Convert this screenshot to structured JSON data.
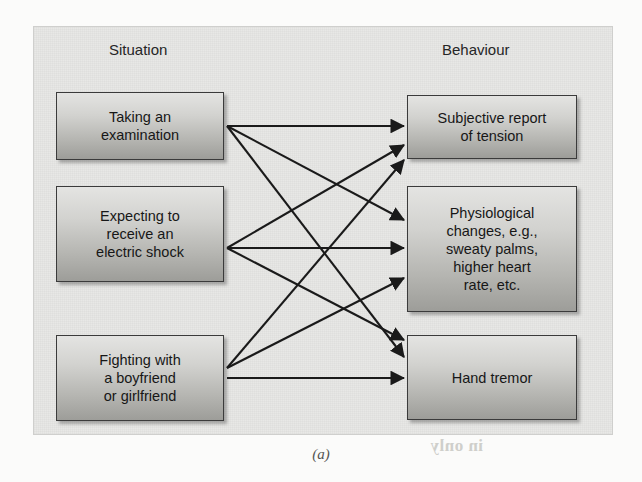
{
  "figure": {
    "caption": "(a)",
    "columns": {
      "left_header": "Situation",
      "right_header": "Behaviour"
    },
    "colors": {
      "frame_background": "#e8e8e6",
      "frame_border": "#cfcfcd",
      "node_border": "#3b3b3b",
      "node_gradient_top": "#e4e4e2",
      "node_gradient_bottom": "#9d9d99",
      "arrow": "#1a1a1a",
      "text": "#171717",
      "page_background": "#fbfbfa"
    },
    "situation_nodes": [
      {
        "id": "exam",
        "lines": [
          "Taking an",
          "examination"
        ]
      },
      {
        "id": "shock",
        "lines": [
          "Expecting to",
          "receive an",
          "electric shock"
        ]
      },
      {
        "id": "fight",
        "lines": [
          "Fighting with",
          "a boyfriend",
          "or girlfriend"
        ]
      }
    ],
    "behaviour_nodes": [
      {
        "id": "tension",
        "lines": [
          "Subjective report",
          "of tension"
        ]
      },
      {
        "id": "physio",
        "lines": [
          "Physiological",
          "changes, e.g.,",
          "sweaty palms,",
          "higher heart",
          "rate, etc."
        ]
      },
      {
        "id": "tremor",
        "lines": [
          "Hand tremor"
        ]
      }
    ],
    "connections": [
      {
        "from": "exam",
        "to": "tension",
        "from_label": "Taking an examination",
        "to_label": "Subjective report of tension"
      },
      {
        "from": "exam",
        "to": "physio",
        "from_label": "Taking an examination",
        "to_label": "Physiological changes"
      },
      {
        "from": "exam",
        "to": "tremor",
        "from_label": "Taking an examination",
        "to_label": "Hand tremor"
      },
      {
        "from": "shock",
        "to": "tension",
        "from_label": "Expecting to receive an electric shock",
        "to_label": "Subjective report of tension"
      },
      {
        "from": "shock",
        "to": "physio",
        "from_label": "Expecting to receive an electric shock",
        "to_label": "Physiological changes"
      },
      {
        "from": "shock",
        "to": "tremor",
        "from_label": "Expecting to receive an electric shock",
        "to_label": "Hand tremor"
      },
      {
        "from": "fight",
        "to": "tension",
        "from_label": "Fighting with a boyfriend or girlfriend",
        "to_label": "Subjective report of tension"
      },
      {
        "from": "fight",
        "to": "physio",
        "from_label": "Fighting with a boyfriend or girlfriend",
        "to_label": "Physiological changes"
      },
      {
        "from": "fight",
        "to": "tremor",
        "from_label": "Fighting with a boyfriend or girlfriend",
        "to_label": "Hand tremor"
      }
    ],
    "bleed_through": [
      {
        "text": "sources",
        "left": 380,
        "top": 368,
        "size": 17
      },
      {
        "text": "soon became",
        "left": 300,
        "top": 392,
        "size": 17
      },
      {
        "text": "present",
        "left": 330,
        "top": 414,
        "size": 17
      },
      {
        "text": "in only",
        "left": 430,
        "top": 436,
        "size": 17
      }
    ]
  }
}
